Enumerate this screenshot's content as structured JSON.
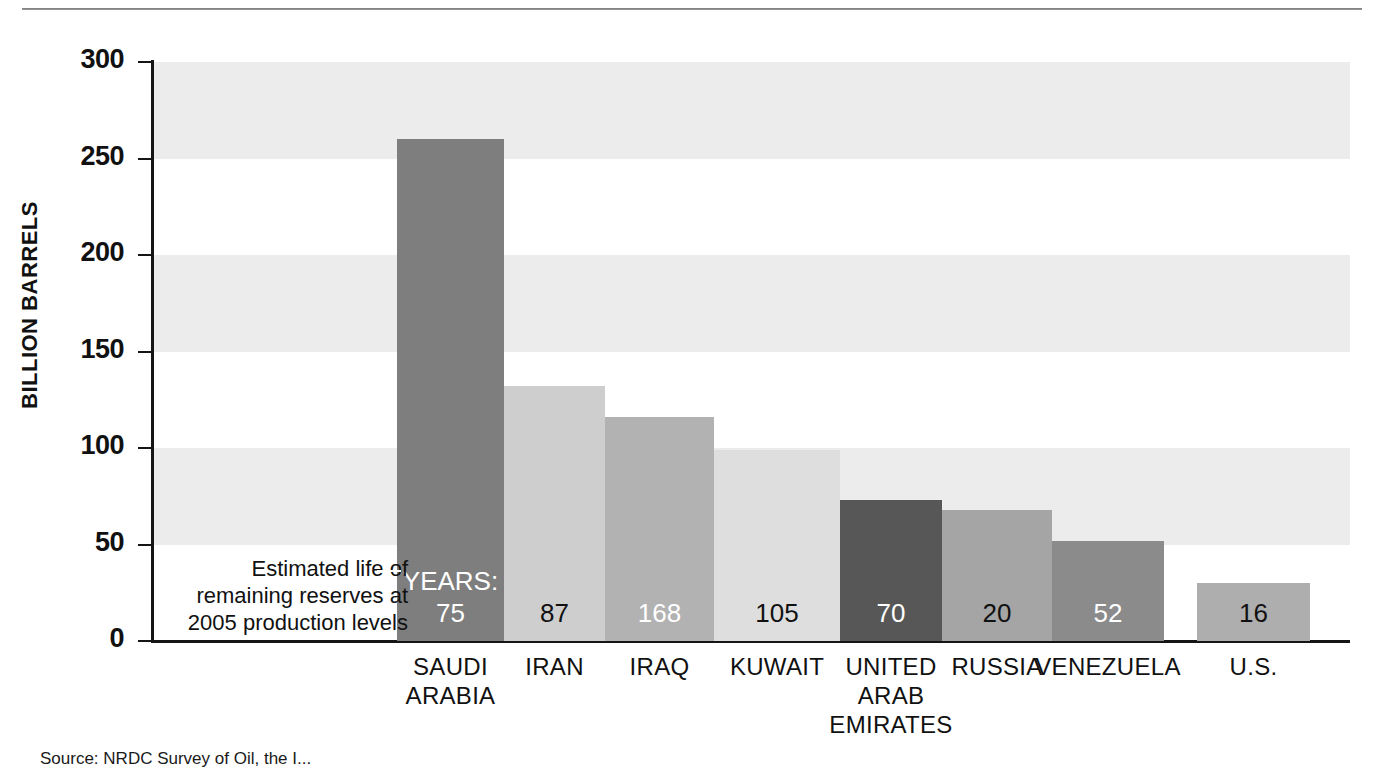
{
  "chart_data": {
    "type": "bar",
    "title": "",
    "xlabel": "",
    "ylabel": "BILLION BARRELS",
    "ylim": [
      0,
      300
    ],
    "yticks": [
      0,
      50,
      100,
      150,
      200,
      250,
      300
    ],
    "grid": "horizontal-bands",
    "legend": "none",
    "categories": [
      "SAUDI ARABIA",
      "IRAN",
      "IRAQ",
      "KUWAIT",
      "UNITED ARAB EMIRATES",
      "RUSSIA",
      "VENEZUELA",
      "U.S."
    ],
    "category_lines": [
      [
        "SAUDI",
        "ARABIA"
      ],
      [
        "IRAN"
      ],
      [
        "IRAQ"
      ],
      [
        "KUWAIT"
      ],
      [
        "UNITED",
        "ARAB",
        "EMIRATES"
      ],
      [
        "RUSSIA"
      ],
      [
        "VENEZUELA"
      ],
      [
        "U.S."
      ]
    ],
    "series": [
      {
        "name": "Proven oil reserves",
        "unit": "billion barrels",
        "values": [
          260,
          132,
          116,
          99,
          73,
          68,
          52,
          30
        ]
      },
      {
        "name": "Estimated life of remaining reserves",
        "unit": "years",
        "values": [
          75,
          87,
          168,
          105,
          70,
          20,
          52,
          16
        ]
      }
    ],
    "bars": [
      {
        "category": "SAUDI ARABIA",
        "reserves": 260,
        "years": 75,
        "color": "#7e7e7e",
        "label_color": "#ffffff"
      },
      {
        "category": "IRAN",
        "reserves": 132,
        "years": 87,
        "color": "#cecece",
        "label_color": "#111111"
      },
      {
        "category": "IRAQ",
        "reserves": 116,
        "years": 168,
        "color": "#b2b2b2",
        "label_color": "#ffffff"
      },
      {
        "category": "KUWAIT",
        "reserves": 99,
        "years": 105,
        "color": "#dedede",
        "label_color": "#111111"
      },
      {
        "category": "UNITED ARAB EMIRATES",
        "reserves": 73,
        "years": 70,
        "color": "#575757",
        "label_color": "#ffffff"
      },
      {
        "category": "RUSSIA",
        "reserves": 68,
        "years": 20,
        "color": "#a5a5a5",
        "label_color": "#111111"
      },
      {
        "category": "VENEZUELA",
        "reserves": 52,
        "years": 52,
        "color": "#8b8b8b",
        "label_color": "#ffffff"
      },
      {
        "category": "U.S.",
        "reserves": 30,
        "years": 16,
        "color": "#aeaeae",
        "label_color": "#111111"
      }
    ],
    "annotation": {
      "line1": "Estimated life of",
      "line2": "remaining reserves at",
      "line3": "2005 production levels",
      "years_prefix": "YEARS:"
    },
    "band_color": "#ececec",
    "axis_color": "#151515"
  },
  "axis": {
    "y_title": "BILLION BARRELS",
    "ticks": [
      "300",
      "250",
      "200",
      "150",
      "100",
      "50",
      "0"
    ]
  },
  "source": {
    "label": "Source:",
    "text": "NRDC Survey of Oil, the I..."
  }
}
